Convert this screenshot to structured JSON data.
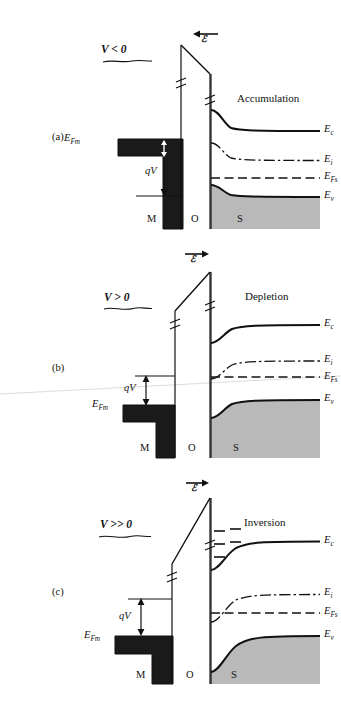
{
  "figure": {
    "type": "mos-energy-band-diagram",
    "regions": {
      "metal": "M",
      "oxide": "O",
      "semiconductor": "S"
    },
    "field_symbol": "ℰ",
    "colors": {
      "metal_fill": "#1a1a1a",
      "valence_fill": "#b9b9b9",
      "line": "#111111",
      "background": "#ffffff",
      "artifact": "#dcdcdc"
    }
  },
  "panels": [
    {
      "tag": "(a)",
      "bias": "V < 0",
      "regime": "Accumulation",
      "field_direction": "left",
      "qv_label": "qV",
      "fermi_metal": "E",
      "fermi_metal_sub": "Fm",
      "levels": [
        {
          "name": "E",
          "sub": "c",
          "style": "solid",
          "bend": "down"
        },
        {
          "name": "E",
          "sub": "i",
          "style": "dash-dot",
          "bend": "down"
        },
        {
          "name": "E",
          "sub": "Fs",
          "style": "dashed",
          "bend": "flat"
        },
        {
          "name": "E",
          "sub": "v",
          "style": "solid",
          "bend": "down"
        }
      ],
      "region_labels": [
        "M",
        "O",
        "S"
      ],
      "inversion_states": 0
    },
    {
      "tag": "(b)",
      "bias": "V > 0",
      "regime": "Depletion",
      "field_direction": "right",
      "qv_label": "qV",
      "fermi_metal": "E",
      "fermi_metal_sub": "Fm",
      "levels": [
        {
          "name": "E",
          "sub": "c",
          "style": "solid",
          "bend": "up"
        },
        {
          "name": "E",
          "sub": "i",
          "style": "dash-dot",
          "bend": "up"
        },
        {
          "name": "E",
          "sub": "Fs",
          "style": "dashed",
          "bend": "flat"
        },
        {
          "name": "E",
          "sub": "v",
          "style": "solid",
          "bend": "up"
        }
      ],
      "region_labels": [
        "M",
        "O",
        "S"
      ],
      "inversion_states": 0
    },
    {
      "tag": "(c)",
      "bias": "V >> 0",
      "regime": "Inversion",
      "field_direction": "right",
      "qv_label": "qV",
      "fermi_metal": "E",
      "fermi_metal_sub": "Fm",
      "levels": [
        {
          "name": "E",
          "sub": "c",
          "style": "solid",
          "bend": "up-strong"
        },
        {
          "name": "E",
          "sub": "i",
          "style": "dash-dot",
          "bend": "up-strong"
        },
        {
          "name": "E",
          "sub": "Fs",
          "style": "dashed",
          "bend": "flat"
        },
        {
          "name": "E",
          "sub": "v",
          "style": "solid",
          "bend": "up-strong"
        }
      ],
      "region_labels": [
        "M",
        "O",
        "S"
      ],
      "inversion_states": 3
    }
  ]
}
